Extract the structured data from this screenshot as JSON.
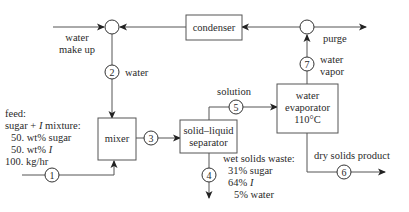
{
  "diagram": {
    "units": {
      "mixer": {
        "label": "mixer"
      },
      "separator": {
        "label_line1": "solid–liquid",
        "label_line2": "separator"
      },
      "evaporator": {
        "label_line1": "water",
        "label_line2": "evaporator",
        "label_line3": "110°C"
      },
      "condenser": {
        "label": "condenser"
      }
    },
    "streams": {
      "s1": {
        "number": "1"
      },
      "s2": {
        "number": "2",
        "label": "water"
      },
      "s3": {
        "number": "3"
      },
      "s4": {
        "number": "4"
      },
      "s5": {
        "number": "5",
        "label": "solution"
      },
      "s6": {
        "number": "6",
        "label": "dry solids product"
      },
      "s7": {
        "number": "7",
        "label_line1": "water",
        "label_line2": "vapor"
      }
    },
    "labels": {
      "makeup_line1": "water",
      "makeup_line2": "make up",
      "purge": "purge",
      "feed": {
        "line1": "feed:",
        "line2_a": "sugar + ",
        "line2_i": "I",
        "line2_b": " mixture:",
        "line3": "50. wt% sugar",
        "line4_a": "50. wt% ",
        "line4_i": "I",
        "line5": "100. kg/hr"
      },
      "waste": {
        "line1": "wet solids waste:",
        "line2": "31% sugar",
        "line3_a": "64% ",
        "line3_i": "I",
        "line4": "5% water"
      }
    },
    "colors": {
      "line": "#555555",
      "arrow": "#222222",
      "text": "#2a2a2a"
    }
  }
}
